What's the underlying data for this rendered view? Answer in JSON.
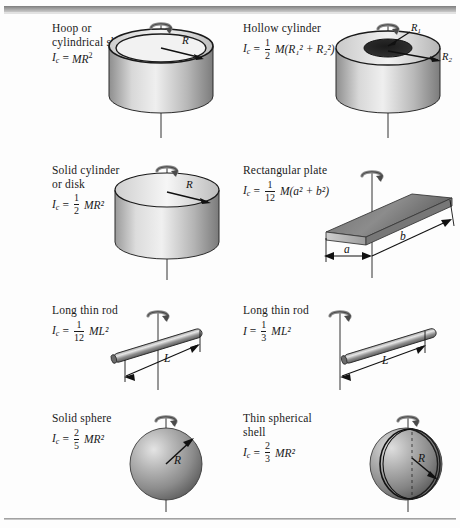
{
  "figure": {
    "background": "#fdfdfd",
    "ink": "#1a1a1a"
  },
  "items": [
    {
      "id": "hoop",
      "name": "hoop-cylindrical-shell",
      "label_line1": "Hoop or",
      "label_line2": "cylindrical shell",
      "symbol": "I",
      "symbol_sub": "c",
      "equals": "=",
      "expression": "MR²",
      "expr_mass": "M",
      "expr_radius": "R",
      "expr_power": "2",
      "dimension_labels": [
        "R"
      ],
      "shape": "cylindrical-shell"
    },
    {
      "id": "hollow-cylinder",
      "name": "hollow-cylinder",
      "label_line1": "Hollow cylinder",
      "label_line2": "",
      "symbol": "I",
      "symbol_sub": "c",
      "equals": "=",
      "fraction_num": "1",
      "fraction_den": "2",
      "expression": "M(R₁² + R₂²)",
      "dimension_labels": [
        "R₁",
        "R₂"
      ],
      "shape": "hollow-cylinder"
    },
    {
      "id": "solid-cylinder",
      "name": "solid-cylinder-or-disk",
      "label_line1": "Solid cylinder",
      "label_line2": "or disk",
      "symbol": "I",
      "symbol_sub": "c",
      "equals": "=",
      "fraction_num": "1",
      "fraction_den": "2",
      "expression": "MR²",
      "dimension_labels": [
        "R"
      ],
      "shape": "solid-cylinder"
    },
    {
      "id": "rect-plate",
      "name": "rectangular-plate",
      "label_line1": "Rectangular plate",
      "label_line2": "",
      "symbol": "I",
      "symbol_sub": "c",
      "equals": "=",
      "fraction_num": "1",
      "fraction_den": "12",
      "expression": "M(a² + b²)",
      "dimension_labels": [
        "a",
        "b"
      ],
      "shape": "rectangular-plate"
    },
    {
      "id": "rod-center",
      "name": "long-thin-rod-center-axis",
      "label_line1": "Long thin rod",
      "label_line2": "",
      "symbol": "I",
      "symbol_sub": "c",
      "equals": "=",
      "fraction_num": "1",
      "fraction_den": "12",
      "expression": "ML²",
      "dimension_labels": [
        "L"
      ],
      "shape": "rod-center"
    },
    {
      "id": "rod-end",
      "name": "long-thin-rod-end-axis",
      "label_line1": "Long thin rod",
      "label_line2": "",
      "symbol": "I",
      "symbol_sub": "",
      "equals": "=",
      "fraction_num": "1",
      "fraction_den": "3",
      "expression": "ML²",
      "dimension_labels": [
        "L"
      ],
      "shape": "rod-end"
    },
    {
      "id": "solid-sphere",
      "name": "solid-sphere",
      "label_line1": "Solid sphere",
      "label_line2": "",
      "symbol": "I",
      "symbol_sub": "c",
      "equals": "=",
      "fraction_num": "2",
      "fraction_den": "5",
      "expression": "MR²",
      "dimension_labels": [
        "R"
      ],
      "shape": "solid-sphere"
    },
    {
      "id": "spherical-shell",
      "name": "thin-spherical-shell",
      "label_line1": "Thin spherical",
      "label_line2": "shell",
      "symbol": "I",
      "symbol_sub": "c",
      "equals": "=",
      "fraction_num": "2",
      "fraction_den": "3",
      "expression": "MR²",
      "dimension_labels": [
        "R"
      ],
      "shape": "spherical-shell"
    }
  ],
  "glyphs": {
    "mass": "M",
    "radius": "R",
    "length": "L",
    "side_a": "a",
    "side_b": "b",
    "inertia": "I",
    "subscript_c": "c",
    "radius_1": "R",
    "radius_2": "R",
    "sub_1": "1",
    "sub_2": "2",
    "sup_2": "2",
    "plus": "+",
    "lparen": "(",
    "rparen": ")"
  }
}
